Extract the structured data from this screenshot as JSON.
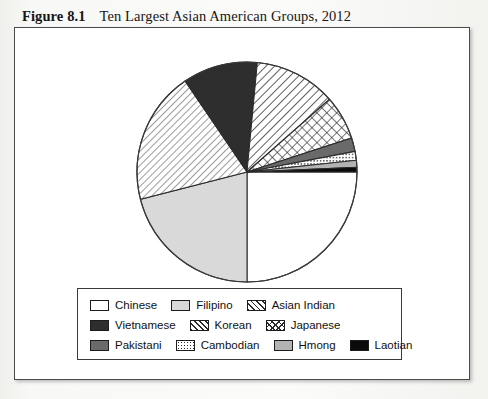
{
  "caption": {
    "figure_number": "Figure 8.1",
    "title": "Ten Largest Asian American Groups, 2012"
  },
  "chart_data": {
    "type": "pie",
    "title": "Ten Largest Asian American Groups, 2012",
    "legend_position": "bottom",
    "start_angle_deg": 0,
    "direction": "clockwise",
    "categories": [
      "Chinese",
      "Filipino",
      "Asian Indian",
      "Vietnamese",
      "Korean",
      "Japanese",
      "Pakistani",
      "Cambodian",
      "Hmong",
      "Laotian"
    ],
    "values": [
      25.0,
      21.0,
      19.5,
      11.0,
      12.0,
      6.5,
      2.0,
      1.3,
      1.0,
      0.7
    ],
    "slices": [
      {
        "label": "Chinese",
        "value": 25.0,
        "start_deg": 0.0,
        "end_deg": 90.0,
        "fill": "white",
        "swatch_class": "sw-chinese"
      },
      {
        "label": "Filipino",
        "value": 21.0,
        "start_deg": 90.0,
        "end_deg": 165.6,
        "fill": "light-gray",
        "swatch_class": "sw-filipino"
      },
      {
        "label": "Asian Indian",
        "value": 19.5,
        "start_deg": 165.6,
        "end_deg": 235.8,
        "fill": "fine-diagonal-hatch",
        "swatch_class": "sw-asianindian"
      },
      {
        "label": "Vietnamese",
        "value": 11.0,
        "start_deg": 235.8,
        "end_deg": 275.4,
        "fill": "dark-solid",
        "swatch_class": "sw-vietnamese"
      },
      {
        "label": "Korean",
        "value": 12.0,
        "start_deg": 275.4,
        "end_deg": 318.6,
        "fill": "diagonal-hatch",
        "swatch_class": "sw-korean"
      },
      {
        "label": "Japanese",
        "value": 6.5,
        "start_deg": 318.6,
        "end_deg": 342.0,
        "fill": "crosshatch",
        "swatch_class": "sw-japanese"
      },
      {
        "label": "Pakistani",
        "value": 2.0,
        "start_deg": 342.0,
        "end_deg": 349.2,
        "fill": "medium-gray",
        "swatch_class": "sw-pakistani"
      },
      {
        "label": "Cambodian",
        "value": 1.3,
        "start_deg": 349.2,
        "end_deg": 353.9,
        "fill": "dotted",
        "swatch_class": "sw-cambodian"
      },
      {
        "label": "Hmong",
        "value": 1.0,
        "start_deg": 353.9,
        "end_deg": 357.5,
        "fill": "gray",
        "swatch_class": "sw-hmong"
      },
      {
        "label": "Laotian",
        "value": 0.7,
        "start_deg": 357.5,
        "end_deg": 360.0,
        "fill": "black",
        "swatch_class": "sw-laotian"
      }
    ]
  },
  "legend": {
    "rows": [
      [
        {
          "label": "Chinese",
          "swatch": "sw-chinese"
        },
        {
          "label": "Filipino",
          "swatch": "sw-filipino"
        },
        {
          "label": "Asian Indian",
          "swatch": "sw-asianindian"
        }
      ],
      [
        {
          "label": "Vietnamese",
          "swatch": "sw-vietnamese"
        },
        {
          "label": "Korean",
          "swatch": "sw-korean"
        },
        {
          "label": "Japanese",
          "swatch": "sw-japanese"
        }
      ],
      [
        {
          "label": "Pakistani",
          "swatch": "sw-pakistani"
        },
        {
          "label": "Cambodian",
          "swatch": "sw-cambodian"
        },
        {
          "label": "Hmong",
          "swatch": "sw-hmong"
        },
        {
          "label": "Laotian",
          "swatch": "sw-laotian"
        }
      ]
    ]
  },
  "colors": {
    "frame_border": "#4b4b4b",
    "outline": "#2b2b2b",
    "white": "#ffffff",
    "light_gray": "#d9d9d9",
    "gray": "#b3b3b3",
    "medium_gray": "#6a6a6a",
    "dark_solid": "#2e2e2e",
    "black": "#0b0b0b"
  }
}
